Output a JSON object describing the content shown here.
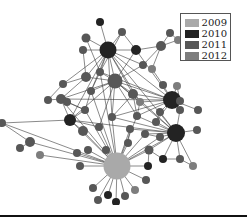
{
  "legend": {
    "items": [
      {
        "label": "2009",
        "color": "#a9a9a9"
      },
      {
        "label": "2010",
        "color": "#232323"
      },
      {
        "label": "2011",
        "color": "#575757"
      },
      {
        "label": "2012",
        "color": "#7d7d7d"
      }
    ]
  },
  "colors": {
    "edge": "#3a3a3a",
    "2009": "#a9a9a9",
    "2010": "#232323",
    "2011": "#575757",
    "2012": "#7d7d7d"
  },
  "nodes": [
    {
      "id": 0,
      "x": 108,
      "y": 50,
      "r": 8.5,
      "year": "2010"
    },
    {
      "id": 1,
      "x": 100,
      "y": 22,
      "r": 4,
      "year": "2010"
    },
    {
      "id": 2,
      "x": 86,
      "y": 38,
      "r": 4.5,
      "year": "2011"
    },
    {
      "id": 3,
      "x": 83,
      "y": 50,
      "r": 4,
      "year": "2011"
    },
    {
      "id": 4,
      "x": 136,
      "y": 50,
      "r": 5,
      "year": "2010"
    },
    {
      "id": 5,
      "x": 122,
      "y": 32,
      "r": 4,
      "year": "2011"
    },
    {
      "id": 6,
      "x": 170,
      "y": 33,
      "r": 4,
      "year": "2011"
    },
    {
      "id": 7,
      "x": 178,
      "y": 40,
      "r": 4,
      "year": "2012"
    },
    {
      "id": 8,
      "x": 161,
      "y": 46,
      "r": 5,
      "year": "2011"
    },
    {
      "id": 9,
      "x": 143,
      "y": 65,
      "r": 4,
      "year": "2011"
    },
    {
      "id": 10,
      "x": 152,
      "y": 69,
      "r": 4,
      "year": "2012"
    },
    {
      "id": 11,
      "x": 115,
      "y": 81,
      "r": 7.5,
      "year": "2011"
    },
    {
      "id": 12,
      "x": 100,
      "y": 72,
      "r": 4,
      "year": "2011"
    },
    {
      "id": 13,
      "x": 86,
      "y": 77,
      "r": 5,
      "year": "2011"
    },
    {
      "id": 14,
      "x": 63,
      "y": 84,
      "r": 4,
      "year": "2011"
    },
    {
      "id": 15,
      "x": 48,
      "y": 100,
      "r": 4,
      "year": "2011"
    },
    {
      "id": 16,
      "x": 61,
      "y": 99,
      "r": 5,
      "year": "2011"
    },
    {
      "id": 17,
      "x": 91,
      "y": 91,
      "r": 4,
      "year": "2011"
    },
    {
      "id": 18,
      "x": 172,
      "y": 100,
      "r": 9,
      "year": "2010"
    },
    {
      "id": 19,
      "x": 163,
      "y": 85,
      "r": 4,
      "year": "2011"
    },
    {
      "id": 20,
      "x": 177,
      "y": 86,
      "r": 4,
      "year": "2012"
    },
    {
      "id": 21,
      "x": 180,
      "y": 101,
      "r": 4,
      "year": "2011"
    },
    {
      "id": 22,
      "x": 180,
      "y": 110,
      "r": 4,
      "year": "2011"
    },
    {
      "id": 23,
      "x": 198,
      "y": 110,
      "r": 4,
      "year": "2011"
    },
    {
      "id": 24,
      "x": 133,
      "y": 94,
      "r": 5,
      "year": "2011"
    },
    {
      "id": 25,
      "x": 140,
      "y": 102,
      "r": 4,
      "year": "2012"
    },
    {
      "id": 26,
      "x": 67,
      "y": 102,
      "r": 4,
      "year": "2011"
    },
    {
      "id": 27,
      "x": 85,
      "y": 110,
      "r": 4,
      "year": "2011"
    },
    {
      "id": 28,
      "x": 70,
      "y": 120,
      "r": 6,
      "year": "2010"
    },
    {
      "id": 29,
      "x": 83,
      "y": 131,
      "r": 5,
      "year": "2011"
    },
    {
      "id": 30,
      "x": 99,
      "y": 127,
      "r": 4,
      "year": "2011"
    },
    {
      "id": 31,
      "x": 112,
      "y": 117,
      "r": 4,
      "year": "2011"
    },
    {
      "id": 32,
      "x": 137,
      "y": 116,
      "r": 4,
      "year": "2011"
    },
    {
      "id": 33,
      "x": 130,
      "y": 129,
      "r": 4,
      "year": "2011"
    },
    {
      "id": 34,
      "x": 106,
      "y": 150,
      "r": 4,
      "year": "2011"
    },
    {
      "id": 35,
      "x": 176,
      "y": 133,
      "r": 9,
      "year": "2010"
    },
    {
      "id": 36,
      "x": 197,
      "y": 130,
      "r": 4,
      "year": "2011"
    },
    {
      "id": 37,
      "x": 160,
      "y": 137,
      "r": 4,
      "year": "2011"
    },
    {
      "id": 38,
      "x": 156,
      "y": 122,
      "r": 4,
      "year": "2011"
    },
    {
      "id": 39,
      "x": 145,
      "y": 134,
      "r": 4,
      "year": "2011"
    },
    {
      "id": 40,
      "x": 149,
      "y": 150,
      "r": 4.5,
      "year": "2011"
    },
    {
      "id": 41,
      "x": 163,
      "y": 159,
      "r": 4,
      "year": "2010"
    },
    {
      "id": 42,
      "x": 180,
      "y": 159,
      "r": 4,
      "year": "2011"
    },
    {
      "id": 43,
      "x": 193,
      "y": 166,
      "r": 4,
      "year": "2012"
    },
    {
      "id": 44,
      "x": 2,
      "y": 123,
      "r": 4,
      "year": "2011"
    },
    {
      "id": 45,
      "x": 30,
      "y": 142,
      "r": 5,
      "year": "2011"
    },
    {
      "id": 46,
      "x": 20,
      "y": 148,
      "r": 4,
      "year": "2011"
    },
    {
      "id": 47,
      "x": 40,
      "y": 155,
      "r": 4,
      "year": "2012"
    },
    {
      "id": 48,
      "x": 77,
      "y": 153,
      "r": 4,
      "year": "2011"
    },
    {
      "id": 49,
      "x": 80,
      "y": 166,
      "r": 4,
      "year": "2011"
    },
    {
      "id": 50,
      "x": 117,
      "y": 166,
      "r": 13.5,
      "year": "2009"
    },
    {
      "id": 51,
      "x": 148,
      "y": 166,
      "r": 4,
      "year": "2010"
    },
    {
      "id": 52,
      "x": 146,
      "y": 180,
      "r": 4,
      "year": "2011"
    },
    {
      "id": 53,
      "x": 88,
      "y": 150,
      "r": 4,
      "year": "2011"
    },
    {
      "id": 54,
      "x": 93,
      "y": 188,
      "r": 4,
      "year": "2011"
    },
    {
      "id": 55,
      "x": 98,
      "y": 200,
      "r": 4,
      "year": "2011"
    },
    {
      "id": 56,
      "x": 108,
      "y": 195,
      "r": 4,
      "year": "2010"
    },
    {
      "id": 57,
      "x": 116,
      "y": 202,
      "r": 4,
      "year": "2010"
    },
    {
      "id": 58,
      "x": 125,
      "y": 196,
      "r": 4,
      "year": "2011"
    },
    {
      "id": 59,
      "x": 135,
      "y": 190,
      "r": 4,
      "year": "2012"
    },
    {
      "id": 60,
      "x": 128,
      "y": 143,
      "r": 4,
      "year": "2011"
    },
    {
      "id": 61,
      "x": 160,
      "y": 112,
      "r": 4,
      "year": "2011"
    }
  ],
  "edges": [
    [
      0,
      1
    ],
    [
      0,
      2
    ],
    [
      0,
      3
    ],
    [
      0,
      4
    ],
    [
      0,
      5
    ],
    [
      0,
      11
    ],
    [
      0,
      12
    ],
    [
      0,
      13
    ],
    [
      0,
      14
    ],
    [
      0,
      17
    ],
    [
      0,
      24
    ],
    [
      0,
      18
    ],
    [
      0,
      35
    ],
    [
      0,
      28
    ],
    [
      0,
      9
    ],
    [
      0,
      31
    ],
    [
      0,
      25
    ],
    [
      4,
      5
    ],
    [
      4,
      8
    ],
    [
      4,
      18
    ],
    [
      4,
      11
    ],
    [
      8,
      6
    ],
    [
      8,
      7
    ],
    [
      8,
      9
    ],
    [
      8,
      10
    ],
    [
      6,
      7
    ],
    [
      10,
      19
    ],
    [
      9,
      11
    ],
    [
      11,
      12
    ],
    [
      11,
      13
    ],
    [
      11,
      17
    ],
    [
      11,
      24
    ],
    [
      11,
      25
    ],
    [
      11,
      31
    ],
    [
      11,
      18
    ],
    [
      11,
      35
    ],
    [
      11,
      28
    ],
    [
      11,
      16
    ],
    [
      11,
      30
    ],
    [
      11,
      32
    ],
    [
      13,
      14
    ],
    [
      13,
      16
    ],
    [
      14,
      15
    ],
    [
      15,
      16
    ],
    [
      16,
      26
    ],
    [
      16,
      27
    ],
    [
      16,
      28
    ],
    [
      16,
      50
    ],
    [
      16,
      18
    ],
    [
      18,
      19
    ],
    [
      18,
      20
    ],
    [
      18,
      21
    ],
    [
      18,
      22
    ],
    [
      18,
      23
    ],
    [
      18,
      24
    ],
    [
      18,
      25
    ],
    [
      18,
      32
    ],
    [
      18,
      38
    ],
    [
      18,
      61
    ],
    [
      18,
      12
    ],
    [
      18,
      31
    ],
    [
      24,
      31
    ],
    [
      24,
      32
    ],
    [
      24,
      35
    ],
    [
      28,
      29
    ],
    [
      28,
      30
    ],
    [
      28,
      27
    ],
    [
      28,
      44
    ],
    [
      28,
      50
    ],
    [
      28,
      35
    ],
    [
      35,
      36
    ],
    [
      35,
      37
    ],
    [
      35,
      38
    ],
    [
      35,
      39
    ],
    [
      35,
      40
    ],
    [
      35,
      41
    ],
    [
      35,
      42
    ],
    [
      35,
      43
    ],
    [
      35,
      61
    ],
    [
      35,
      22
    ],
    [
      35,
      32
    ],
    [
      35,
      33
    ],
    [
      35,
      50
    ],
    [
      35,
      31
    ],
    [
      44,
      45
    ],
    [
      44,
      50
    ],
    [
      45,
      46
    ],
    [
      45,
      50
    ],
    [
      47,
      50
    ],
    [
      29,
      50
    ],
    [
      30,
      50
    ],
    [
      31,
      50
    ],
    [
      33,
      50
    ],
    [
      34,
      50
    ],
    [
      48,
      50
    ],
    [
      49,
      50
    ],
    [
      53,
      50
    ],
    [
      50,
      51
    ],
    [
      50,
      52
    ],
    [
      50,
      54
    ],
    [
      50,
      55
    ],
    [
      50,
      56
    ],
    [
      50,
      57
    ],
    [
      50,
      58
    ],
    [
      50,
      59
    ],
    [
      50,
      60
    ],
    [
      50,
      39
    ],
    [
      50,
      40
    ],
    [
      50,
      37
    ],
    [
      50,
      32
    ],
    [
      50,
      27
    ],
    [
      50,
      17
    ],
    [
      50,
      12
    ],
    [
      40,
      41
    ],
    [
      40,
      51
    ],
    [
      41,
      42
    ],
    [
      42,
      43
    ],
    [
      38,
      61
    ],
    [
      37,
      39
    ],
    [
      33,
      60
    ],
    [
      3,
      13
    ],
    [
      2,
      12
    ],
    [
      5,
      12
    ],
    [
      25,
      32
    ],
    [
      26,
      27
    ],
    [
      17,
      27
    ],
    [
      20,
      21
    ],
    [
      12,
      17
    ]
  ]
}
